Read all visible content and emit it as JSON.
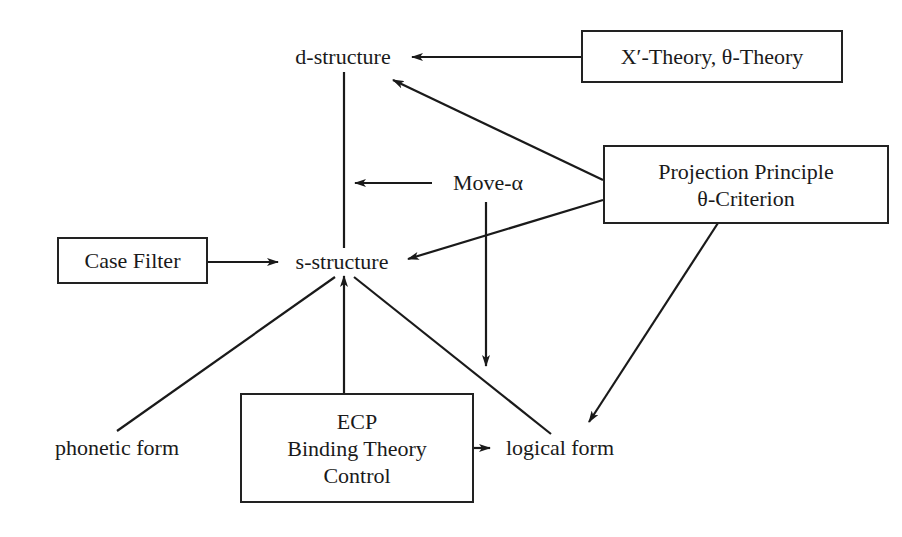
{
  "diagram": {
    "nodes": {
      "d_structure": "d-structure",
      "s_structure": "s-structure",
      "move_alpha": "Move-α",
      "phonetic_form": "phonetic form",
      "logical_form": "logical form"
    },
    "boxes": {
      "xbar_theta": "X′-Theory, θ-Theory",
      "projection": [
        "Projection Principle",
        "θ-Criterion"
      ],
      "case_filter": "Case Filter",
      "ecp_binding": [
        "ECP",
        "Binding Theory",
        "Control"
      ]
    },
    "edges": [
      {
        "from": "X′-Theory, θ-Theory",
        "to": "d-structure",
        "arrow": true
      },
      {
        "from": "Projection Principle θ-Criterion",
        "to": "d-structure",
        "arrow": true
      },
      {
        "from": "Projection Principle θ-Criterion",
        "to": "s-structure",
        "arrow": true
      },
      {
        "from": "Projection Principle θ-Criterion",
        "to": "logical form",
        "arrow": true
      },
      {
        "from": "d-structure",
        "to": "s-structure",
        "arrow": false
      },
      {
        "from": "Move-α",
        "to": "d-structure/s-structure line",
        "arrow": true
      },
      {
        "from": "Move-α",
        "to": "s-structure/logical form line",
        "arrow": true
      },
      {
        "from": "Case Filter",
        "to": "s-structure",
        "arrow": true
      },
      {
        "from": "ECP Binding Theory Control",
        "to": "s-structure",
        "arrow": true
      },
      {
        "from": "ECP Binding Theory Control",
        "to": "logical form",
        "arrow": true
      },
      {
        "from": "s-structure",
        "to": "phonetic form",
        "arrow": false
      },
      {
        "from": "s-structure",
        "to": "logical form",
        "arrow": false
      }
    ]
  }
}
